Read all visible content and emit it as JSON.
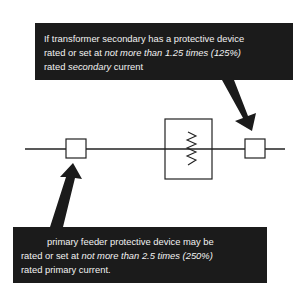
{
  "diagram": {
    "colors": {
      "callout_bg": "#1b1b1b",
      "callout_text": "#f2f2f2",
      "line": "#222222",
      "background": "#ffffff"
    },
    "components": [
      {
        "id": "primary-protective-device",
        "type": "box",
        "label": ""
      },
      {
        "id": "transformer",
        "type": "transformer-symbol",
        "label": ""
      },
      {
        "id": "secondary-protective-device",
        "type": "box",
        "label": ""
      }
    ],
    "callouts": {
      "top": {
        "target": "secondary-protective-device",
        "line1": "If transformer secondary has a protective device",
        "line2_prefix": "rated or set at ",
        "line2_emph": "not more than 1.25 times (125%)",
        "line3_prefix": "rated ",
        "line3_emph": "secondary",
        "line3_suffix": " current"
      },
      "bottom": {
        "target": "primary-protective-device",
        "line1": "primary feeder protective device may be",
        "line2_prefix": "rated or set at ",
        "line2_emph": "not more than 2.5 times (250%)",
        "line3": "rated primary current."
      }
    }
  }
}
